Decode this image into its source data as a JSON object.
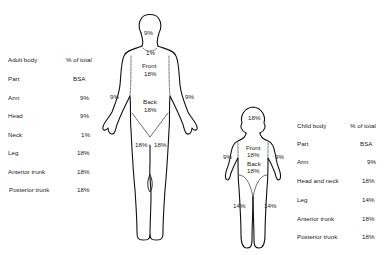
{
  "adult_table": {
    "header": {
      "label": "Adult body",
      "value": "% of total"
    },
    "subheader": {
      "label": "Part",
      "value": "BSA"
    },
    "rows": [
      {
        "label": "Arm",
        "value": "9%"
      },
      {
        "label": "Head",
        "value": "9%"
      },
      {
        "label": "Neck",
        "value": "1%"
      },
      {
        "label": "Leg",
        "value": "18%"
      },
      {
        "label": "Anterior trunk",
        "value": "18%"
      },
      {
        "label": "Posterior trunk",
        "value": "18%"
      }
    ]
  },
  "child_table": {
    "header": {
      "label": "Child body",
      "value": "% of total"
    },
    "subheader": {
      "label": "Part",
      "value": "BSA"
    },
    "rows": [
      {
        "label": "Arm",
        "value": "9%"
      },
      {
        "label": "Head and neck",
        "value": "18%"
      },
      {
        "label": "Leg",
        "value": "14%"
      },
      {
        "label": "Anterior trunk",
        "value": "18%"
      },
      {
        "label": "Posterior trunk",
        "value": "18%"
      }
    ]
  },
  "adult_figure": {
    "head": "9%",
    "neck": "1%",
    "front_label": "Front",
    "front_value": "18%",
    "back_label": "Back",
    "back_value": "18%",
    "left_arm": "9%",
    "right_arm": "9%",
    "left_leg": "18%",
    "right_leg": "18%"
  },
  "child_figure": {
    "head": "18%",
    "front_label": "Front",
    "front_value": "18%",
    "back_label": "Back",
    "back_value": "18%",
    "left_arm": "9%",
    "right_arm": "9%",
    "left_leg": "14%",
    "right_leg": "14%"
  }
}
